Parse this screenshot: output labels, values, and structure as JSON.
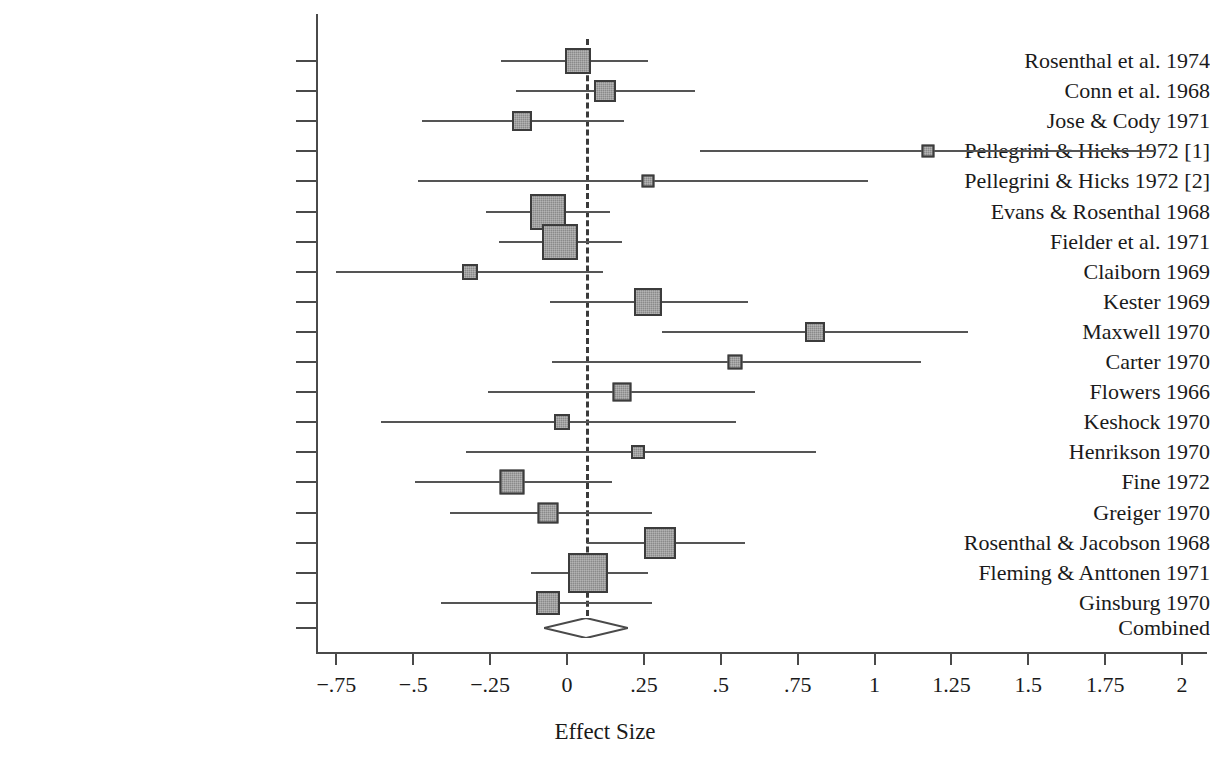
{
  "chart_data": {
    "type": "forest",
    "title": "",
    "xlabel": "Effect Size",
    "ylabel": "",
    "xlim": [
      -0.92,
      2.08
    ],
    "grid": false,
    "legend": null,
    "xticks": [
      -0.75,
      -0.5,
      -0.25,
      0,
      0.25,
      0.5,
      0.75,
      1,
      1.25,
      1.5,
      1.75,
      2
    ],
    "xticklabels": [
      "−.75",
      "−.5",
      "−.25",
      "0",
      ".25",
      ".5",
      ".75",
      "1",
      "1.25",
      "1.5",
      "1.75",
      "2"
    ],
    "reference_line": {
      "value": 0.062,
      "style": "dashed"
    },
    "studies": [
      {
        "label": "Rosenthal et al. 1974",
        "effect": 0.036,
        "ci_low": -0.215,
        "ci_high": 0.265,
        "weight_px": 26
      },
      {
        "label": "Conn et al. 1968",
        "effect": 0.122,
        "ci_low": -0.165,
        "ci_high": 0.415,
        "weight_px": 22
      },
      {
        "label": "Jose & Cody 1971",
        "effect": -0.145,
        "ci_low": -0.47,
        "ci_high": 0.185,
        "weight_px": 20
      },
      {
        "label": "Pellegrini & Hicks 1972 [1]",
        "effect": 1.175,
        "ci_low": 0.433,
        "ci_high": 1.915,
        "weight_px": 13
      },
      {
        "label": "Pellegrini & Hicks 1972 [2]",
        "effect": 0.264,
        "ci_low": -0.485,
        "ci_high": 0.98,
        "weight_px": 13
      },
      {
        "label": "Evans & Rosenthal 1968",
        "effect": -0.062,
        "ci_low": -0.262,
        "ci_high": 0.14,
        "weight_px": 36
      },
      {
        "label": "Fielder et al. 1971",
        "effect": -0.023,
        "ci_low": -0.22,
        "ci_high": 0.18,
        "weight_px": 36
      },
      {
        "label": "Claiborn 1969",
        "effect": -0.315,
        "ci_low": -0.75,
        "ci_high": 0.118,
        "weight_px": 16
      },
      {
        "label": "Kester 1969",
        "effect": 0.264,
        "ci_low": -0.055,
        "ci_high": 0.59,
        "weight_px": 28
      },
      {
        "label": "Maxwell 1970",
        "effect": 0.807,
        "ci_low": 0.31,
        "ci_high": 1.305,
        "weight_px": 20
      },
      {
        "label": "Carter 1970",
        "effect": 0.546,
        "ci_low": -0.05,
        "ci_high": 1.15,
        "weight_px": 15
      },
      {
        "label": "Flowers 1966",
        "effect": 0.179,
        "ci_low": -0.258,
        "ci_high": 0.612,
        "weight_px": 19
      },
      {
        "label": "Keshock 1970",
        "effect": -0.016,
        "ci_low": -0.605,
        "ci_high": 0.55,
        "weight_px": 16
      },
      {
        "label": "Henrikson 1970",
        "effect": 0.231,
        "ci_low": -0.33,
        "ci_high": 0.81,
        "weight_px": 14
      },
      {
        "label": "Fine 1972",
        "effect": -0.179,
        "ci_low": -0.495,
        "ci_high": 0.145,
        "weight_px": 25
      },
      {
        "label": "Greiger 1970",
        "effect": -0.062,
        "ci_low": -0.38,
        "ci_high": 0.275,
        "weight_px": 21
      },
      {
        "label": "Rosenthal & Jacobson 1968",
        "effect": 0.303,
        "ci_low": 0.065,
        "ci_high": 0.58,
        "weight_px": 32
      },
      {
        "label": "Fleming & Anttonen 1971",
        "effect": 0.069,
        "ci_low": -0.118,
        "ci_high": 0.262,
        "weight_px": 40
      },
      {
        "label": "Ginsburg 1970",
        "effect": -0.062,
        "ci_low": -0.41,
        "ci_high": 0.275,
        "weight_px": 24
      }
    ],
    "combined": {
      "label": "Combined",
      "effect": 0.062,
      "ci_low": -0.016,
      "ci_high": 0.14
    }
  },
  "colors": {
    "axis": "#4a4a4a",
    "ci_line": "#555555",
    "marker_fill": "#8a8a8a",
    "marker_border": "#3c3c3c",
    "reference": "#3a3a3a",
    "text": "#1a1a1a",
    "background": "#ffffff"
  }
}
